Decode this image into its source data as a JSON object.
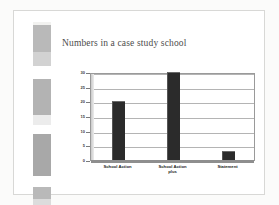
{
  "slide": {
    "title": "Numbers in a case study school",
    "background_color": "#ffffff",
    "frame_color": "#d8d8d6"
  },
  "left_strip": {
    "name": "decorative-film-strip",
    "base_color": "#f2f2f0",
    "blocks": [
      {
        "top": 3,
        "height": 27,
        "color": "#b9b9b9"
      },
      {
        "top": 30,
        "height": 14,
        "color": "#d2d2d2"
      },
      {
        "top": 44,
        "height": 13,
        "color": "#ffffff"
      },
      {
        "top": 57,
        "height": 36,
        "color": "#b3b3b3"
      },
      {
        "top": 93,
        "height": 10,
        "color": "#ececec"
      },
      {
        "top": 103,
        "height": 9,
        "color": "#ffffff"
      },
      {
        "top": 112,
        "height": 42,
        "color": "#a8a8a8"
      },
      {
        "top": 154,
        "height": 11,
        "color": "#ffffff"
      },
      {
        "top": 165,
        "height": 12,
        "color": "#b9b9b9"
      },
      {
        "top": 177,
        "height": 6,
        "color": "#dcdcdc"
      }
    ]
  },
  "chart_data": {
    "type": "bar",
    "title": "Numbers in a case study school",
    "xlabel": "",
    "ylabel": "",
    "categories": [
      "School Action",
      "School Action plus",
      "Statement"
    ],
    "values": [
      20,
      30,
      3
    ],
    "ylim": [
      0,
      30
    ],
    "ytick_step": 5,
    "yticks": [
      30,
      25,
      20,
      15,
      10,
      5,
      0
    ],
    "ytick_labels": [
      "30",
      "25",
      "20",
      "15",
      "10",
      "5",
      "0"
    ],
    "grid": true,
    "grid_axis": "y",
    "legend": false,
    "legend_position": "none",
    "bar_color": "#2b2b2b",
    "plot_background": "#ffffff",
    "axis_color": "#9a9a9a",
    "gridline_color": "#b4b4b4",
    "category_lines": [
      [
        "School Action"
      ],
      [
        "School Action",
        "plus"
      ],
      [
        "Statement"
      ]
    ]
  }
}
